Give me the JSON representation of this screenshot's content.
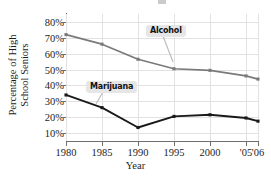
{
  "chart_data": {
    "type": "line",
    "title": "",
    "xlabel": "Year",
    "ylabel": "Percentage of High School Seniors",
    "ylabel_line1": "Percentage of High",
    "ylabel_line2": "School Seniors",
    "x": [
      1980,
      1985,
      1990,
      1995,
      2000,
      2005,
      2006
    ],
    "categories": [
      "1980",
      "1985",
      "1990",
      "1995",
      "2000",
      "'05",
      "'06"
    ],
    "xtick_labels": [
      "1980",
      "1985",
      "1990",
      "1995",
      "2000",
      "'05",
      "'06"
    ],
    "ytick_labels": [
      "80%",
      "70%",
      "60%",
      "50%",
      "40%",
      "30%",
      "20%",
      "10%"
    ],
    "ytick_values": [
      80,
      70,
      60,
      50,
      40,
      30,
      20,
      10
    ],
    "ylim": [
      5,
      85
    ],
    "xlim": [
      1979,
      2007
    ],
    "grid": true,
    "legend": "callout-labels",
    "legend_position": "inline-annotations",
    "series": [
      {
        "name": "Alcohol",
        "color": "#7a7a7a",
        "marker": "square",
        "values": [
          72,
          66,
          56.5,
          50.5,
          49.5,
          46,
          44
        ]
      },
      {
        "name": "Marijuana",
        "color": "#1a1a1a",
        "marker": "square",
        "values": [
          34,
          26,
          13.5,
          20.5,
          21.5,
          19.5,
          17.5
        ]
      }
    ],
    "annotations": [
      {
        "text": "Alcohol",
        "anchor_series": "Alcohol",
        "anchor_x": 1995
      },
      {
        "text": "Marijuana",
        "anchor_series": "Marijuana",
        "anchor_x": 1985
      }
    ]
  },
  "colors": {
    "alcohol_line": "#7a7a7a",
    "marijuana_line": "#1a1a1a",
    "gridline": "#e2e2e2",
    "axis": "#6f6f6f",
    "callout_bg": "#e6e6e6",
    "text": "#1d1d1d",
    "background": "#ffffff"
  }
}
